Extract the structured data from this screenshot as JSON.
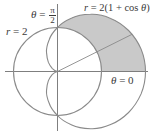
{
  "figure": {
    "type": "polar-region-diagram",
    "curves": [
      {
        "name": "circle",
        "equation": "r = 2",
        "label": "r = 2"
      },
      {
        "name": "cardioid",
        "equation": "r = 2(1 + cos θ)",
        "label": "r = 2(1 + cos θ)"
      }
    ],
    "axis_labels": {
      "vertical": {
        "lhs": "θ =",
        "num": "π",
        "den": "2"
      },
      "horizontal": "θ = 0"
    },
    "shaded_region": "inside cardioid, outside circle, 0 ≤ θ ≤ π/2",
    "colors": {
      "curve": "#8a8a8a",
      "axis": "#707070",
      "shade": "#c9c9c9",
      "text": "#3a3a3a"
    }
  },
  "labels": {
    "circle": "r = 2",
    "cardioid_lhs": "r",
    "cardioid_rhs": " = 2(1 + cos ",
    "cardioid_theta": "θ",
    "cardioid_close": ")",
    "theta_half_pi_lhs": "θ",
    "theta_half_pi_eq": " = ",
    "pi": "π",
    "two": "2",
    "theta_zero_lhs": "θ",
    "theta_zero_rhs": " = 0",
    "r_var": "r",
    "r_value": " = 2"
  }
}
